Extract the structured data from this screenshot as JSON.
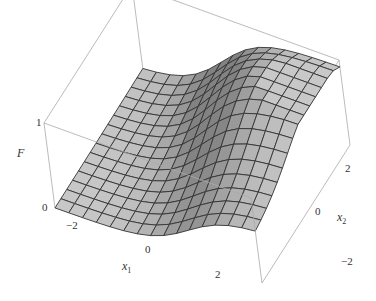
{
  "chart_data": {
    "type": "surface3d",
    "title": "",
    "function_description": "Smooth sigmoid-like step surface F(x1,x2) rising from 0 to 1, increasing along x1 with a ridge in x2",
    "axes": {
      "x1": {
        "label": "x",
        "sub": "1",
        "ticks": [
          "-2",
          "0",
          "2"
        ],
        "range": [
          -3,
          3
        ]
      },
      "x2": {
        "label": "x",
        "sub": "2",
        "ticks": [
          "-2",
          "0",
          "2"
        ],
        "range": [
          -3,
          3
        ]
      },
      "F": {
        "label": "F",
        "ticks": [
          "0",
          "1"
        ],
        "range": [
          0,
          1
        ]
      }
    },
    "grid": {
      "n": 15
    },
    "box": true,
    "colors": {
      "surface_light": "#c8c8c8",
      "surface_dark": "#8a8a8a",
      "mesh": "#333333",
      "box": "#aaaaaa"
    }
  },
  "labels": {
    "F": "F",
    "F0": "0",
    "F1": "1",
    "x1": "x",
    "x1sub": "1",
    "x2": "x",
    "x2sub": "2",
    "x1t0": "−2",
    "x1t1": "0",
    "x1t2": "2",
    "x2t0": "−2",
    "x2t1": "0",
    "x2t2": "2"
  }
}
